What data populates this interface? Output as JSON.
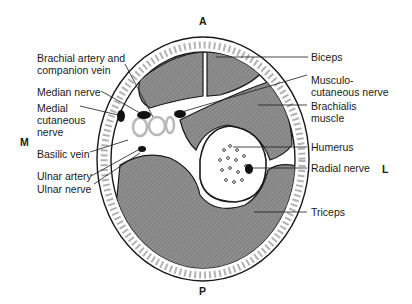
{
  "figure": {
    "orientation": {
      "anterior": "A",
      "posterior": "P",
      "medial": "M",
      "lateral": "L"
    },
    "labels_left": [
      {
        "id": "brachial-artery",
        "text": "Brachial artery and\ncompanion vein"
      },
      {
        "id": "median-nerve",
        "text": "Median nerve"
      },
      {
        "id": "medial-cutaneous-nerve",
        "text": "Medial\ncutaneous\nnerve"
      },
      {
        "id": "basilic-vein",
        "text": "Basilic vein"
      },
      {
        "id": "ulnar-artery",
        "text": "Ulnar artery"
      },
      {
        "id": "ulnar-nerve",
        "text": "Ulnar nerve"
      }
    ],
    "labels_right": [
      {
        "id": "biceps",
        "text": "Biceps"
      },
      {
        "id": "musculocutaneous-nerve",
        "text": "Musculo-\ncutaneous nerve"
      },
      {
        "id": "brachialis-muscle",
        "text": "Brachialis\nmuscle"
      },
      {
        "id": "humerus",
        "text": "Humerus"
      },
      {
        "id": "radial-nerve",
        "text": "Radial nerve"
      },
      {
        "id": "triceps",
        "text": "Triceps"
      }
    ],
    "colors": {
      "muscle": "#8a8a8a",
      "outline": "#1a1a1a",
      "background": "#ffffff",
      "vessel": "#b8b8b8"
    }
  }
}
